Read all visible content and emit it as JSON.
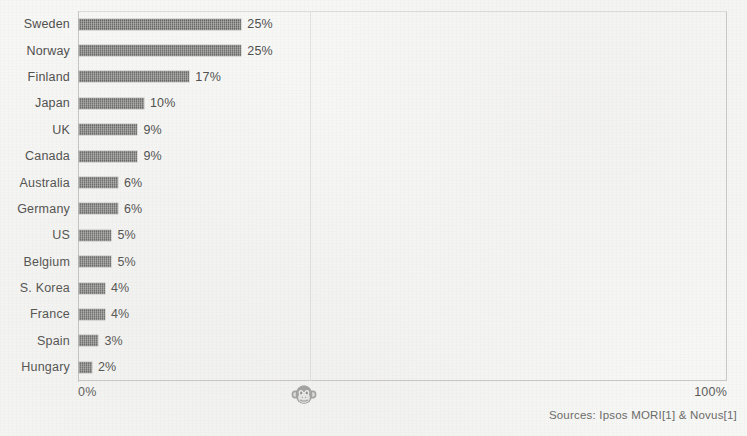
{
  "chart_data": {
    "type": "bar",
    "orientation": "horizontal",
    "title": "",
    "subtitle": "",
    "xlabel": "",
    "ylabel": "",
    "categories": [
      "Sweden",
      "Norway",
      "Finland",
      "Japan",
      "UK",
      "Canada",
      "Australia",
      "Germany",
      "US",
      "Belgium",
      "S. Korea",
      "France",
      "Spain",
      "Hungary"
    ],
    "values": [
      25,
      25,
      17,
      10,
      9,
      9,
      6,
      6,
      5,
      5,
      4,
      4,
      3,
      2
    ],
    "value_labels": [
      "25%",
      "25%",
      "17%",
      "10%",
      "9%",
      "9%",
      "6%",
      "6%",
      "5%",
      "5%",
      "4%",
      "4%",
      "3%",
      "2%"
    ],
    "xlim": [
      0,
      100
    ],
    "x_tick_labels": [
      "0%",
      "100%"
    ],
    "grid": true,
    "gridlines_at": [
      35.7
    ],
    "legend": "none",
    "bar_color": "#6f6f6d",
    "axis_color": "#c9c9c6",
    "text_color": "#4e4e4c",
    "background_color": "#f7f7f6"
  },
  "axis": {
    "left_tick": "0%",
    "right_tick": "100%"
  },
  "footer": {
    "sources": "Sources: Ipsos MORI[1] & Novus[1]"
  },
  "watermark": {
    "icon": "monkey-face-icon"
  }
}
